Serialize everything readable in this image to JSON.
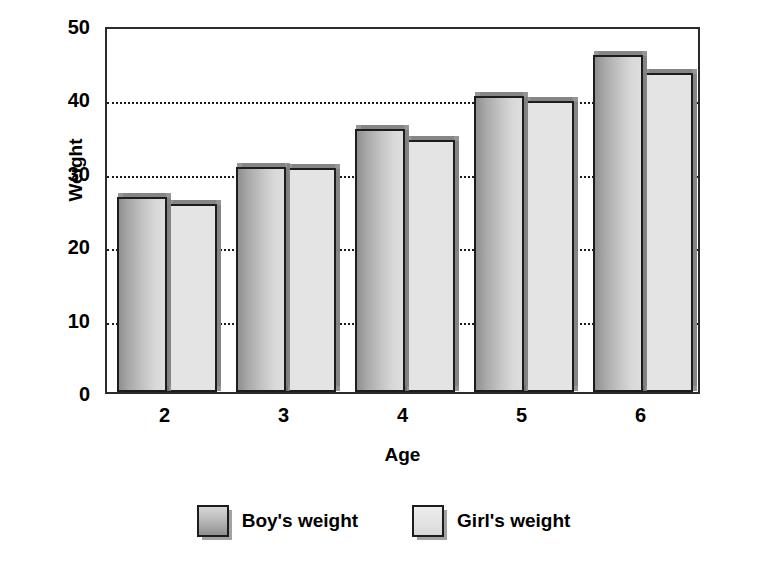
{
  "chart_data": {
    "type": "bar",
    "title": "",
    "subtitle": "",
    "xlabel": "Age",
    "ylabel": "Weight",
    "categories": [
      "2",
      "3",
      "4",
      "5",
      "6"
    ],
    "series": [
      {
        "name": "Boy's weight",
        "values": [
          26.6,
          30.6,
          35.9,
          40.3,
          45.9
        ]
      },
      {
        "name": "Girl's weight",
        "values": [
          25.6,
          30.5,
          34.4,
          39.6,
          43.5
        ]
      }
    ],
    "ylim": [
      0,
      50
    ],
    "yticks": [
      0,
      10,
      20,
      30,
      40,
      50
    ],
    "ytick_labels": [
      "0",
      "10",
      "20",
      "30",
      "40",
      "50"
    ],
    "grid": true,
    "grid_axis": "y",
    "grid_style": "dotted",
    "grid_values": [
      10,
      20,
      30,
      40
    ],
    "legend_position": "bottom-center",
    "legend_entries": [
      "Boy's weight",
      "Girl's weight"
    ],
    "annotations": []
  },
  "colors": {
    "boy_bar_dark": "#8f8f8f",
    "boy_bar_light": "#dedede",
    "girl_bar": "#e4e4e4",
    "bar_outline": "#1c1c1c",
    "shadow": "#828282",
    "axis": "#2b2b2b",
    "gridline": "#1a1a1a",
    "text": "#000000",
    "background": "#ffffff"
  }
}
